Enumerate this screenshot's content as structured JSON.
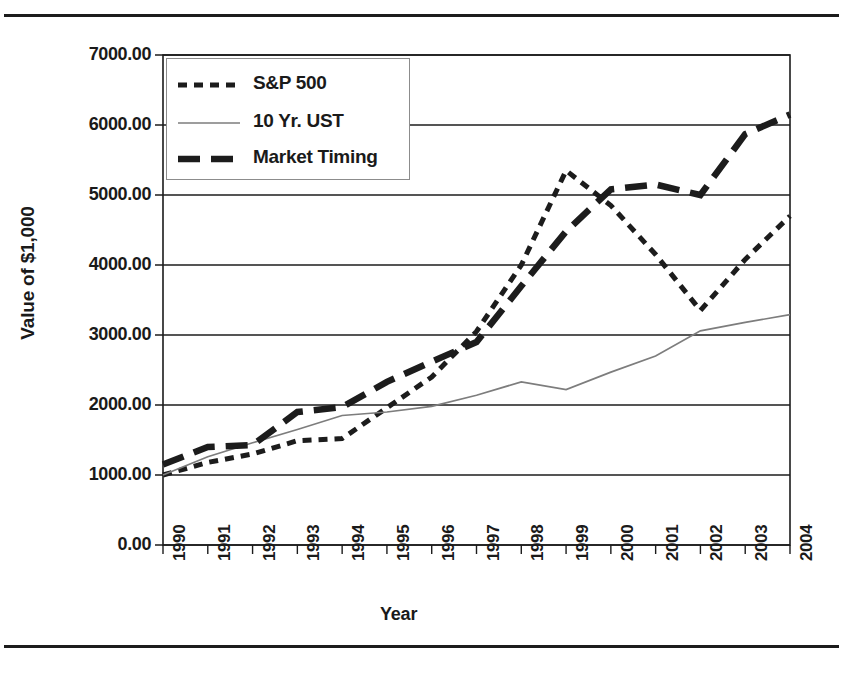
{
  "figure": {
    "has_top_rule": true,
    "has_bottom_rule": true,
    "background_color": "#ffffff",
    "ink_color": "#1c1c1c"
  },
  "legend": {
    "position": "top-left-inside",
    "entries": [
      {
        "label": "S&P 500",
        "style": "short-dash",
        "color": "#1c1c1c",
        "width": 5
      },
      {
        "label": "10 Yr. UST",
        "style": "thin-solid",
        "color": "#7d7d7d",
        "width": 1.6
      },
      {
        "label": "Market Timing",
        "style": "long-dash",
        "color": "#1c1c1c",
        "width": 6
      }
    ]
  },
  "axes": {
    "y": {
      "title": "Value of $1,000",
      "ticks": [
        "0.00",
        "1000.00",
        "2000.00",
        "3000.00",
        "4000.00",
        "5000.00",
        "6000.00",
        "7000.00"
      ],
      "min": 0,
      "max": 7000,
      "step": 1000,
      "gridlines": true
    },
    "x": {
      "title": "Year",
      "ticks": [
        "1990",
        "1991",
        "1992",
        "1993",
        "1994",
        "1995",
        "1996",
        "1997",
        "1998",
        "1999",
        "2000",
        "2001",
        "2002",
        "2003",
        "2004"
      ],
      "label_rotation": -90
    }
  },
  "chart_data": {
    "type": "line",
    "title": "",
    "xlabel": "Year",
    "ylabel": "Value of $1,000",
    "categories": [
      "1990",
      "1991",
      "1992",
      "1993",
      "1994",
      "1995",
      "1996",
      "1997",
      "1998",
      "1999",
      "2000",
      "2001",
      "2002",
      "2003",
      "2004"
    ],
    "x": [
      1990,
      1991,
      1992,
      1993,
      1994,
      1995,
      1996,
      1997,
      1998,
      1999,
      2000,
      2001,
      2002,
      2003,
      2004
    ],
    "ylim": [
      0,
      7000
    ],
    "grid": true,
    "legend_position": "upper left",
    "series": [
      {
        "name": "S&P 500",
        "style": "short-dash",
        "color": "#1c1c1c",
        "values": [
          1000,
          1180,
          1300,
          1490,
          1520,
          1960,
          2400,
          3050,
          4000,
          5350,
          4850,
          4150,
          3350,
          4080,
          4700
        ]
      },
      {
        "name": "10 Yr. UST",
        "style": "thin-solid",
        "color": "#7d7d7d",
        "values": [
          1000,
          1260,
          1460,
          1650,
          1850,
          1900,
          1980,
          2140,
          2330,
          2220,
          2470,
          2700,
          3060,
          3180,
          3290
        ]
      },
      {
        "name": "Market Timing",
        "style": "long-dash",
        "color": "#1c1c1c",
        "values": [
          1150,
          1400,
          1430,
          1900,
          1970,
          2330,
          2620,
          2900,
          3700,
          4480,
          5080,
          5150,
          5000,
          5870,
          6150
        ]
      }
    ]
  }
}
